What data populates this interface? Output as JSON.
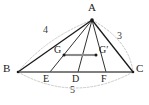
{
  "figure": {
    "background_color": "#ffffff",
    "stroke_color": "#1a1a1a",
    "midsegment_color": "#8a8a8a",
    "arc_color": "#b5b5b5",
    "vertices": [
      {
        "name": "A",
        "label": "A",
        "x": 92,
        "y": 20,
        "label_x": 88,
        "label_y": 4,
        "dot": true
      },
      {
        "name": "B",
        "label": "B",
        "x": 18,
        "y": 72,
        "label_x": 4,
        "label_y": 64,
        "dot": true
      },
      {
        "name": "C",
        "label": "C",
        "x": 133,
        "y": 72,
        "label_x": 137,
        "label_y": 64,
        "dot": true
      }
    ],
    "base_points": [
      {
        "name": "E",
        "label": "E",
        "x": 50,
        "y": 72,
        "label_x": 44,
        "label_y": 76
      },
      {
        "name": "D",
        "label": "D",
        "x": 78,
        "y": 72,
        "label_x": 72,
        "label_y": 76
      },
      {
        "name": "F",
        "label": "F",
        "x": 106,
        "y": 72,
        "label_x": 100,
        "label_y": 76
      }
    ],
    "interior_points": [
      {
        "name": "G",
        "label": "G",
        "x": 64,
        "y": 55,
        "label_x": 54,
        "label_y": 46,
        "dot": true
      },
      {
        "name": "G'",
        "label": "G′",
        "x": 96,
        "y": 55,
        "label_x": 100,
        "label_y": 46,
        "dot": true
      }
    ],
    "segments": [
      {
        "name": "side-AB",
        "from": "A",
        "to": "B",
        "style": "solid",
        "color": "#1a1a1a",
        "width": 1.3
      },
      {
        "name": "side-AC",
        "from": "A",
        "to": "C",
        "style": "solid",
        "color": "#1a1a1a",
        "width": 1.3
      },
      {
        "name": "side-BC",
        "from": "B",
        "to": "C",
        "style": "solid",
        "color": "#555555",
        "width": 1.3
      },
      {
        "name": "cevian-AE",
        "from": "A",
        "to": "E",
        "style": "solid",
        "color": "#1a1a1a",
        "width": 0.9
      },
      {
        "name": "cevian-AD",
        "from": "A",
        "to": "D",
        "style": "solid",
        "color": "#1a1a1a",
        "width": 0.9
      },
      {
        "name": "cevian-AF",
        "from": "A",
        "to": "F",
        "style": "solid",
        "color": "#1a1a1a",
        "width": 0.9
      },
      {
        "name": "midsegment-GG-prime",
        "from": "G",
        "to": "G'",
        "style": "solid",
        "color": "#8a8a8a",
        "width": 2.0
      }
    ],
    "arcs": [
      {
        "name": "arc-side-AB",
        "label": "4",
        "from": "B",
        "to": "A",
        "bulge": "outward-left",
        "label_x": 44,
        "label_y": 27
      },
      {
        "name": "arc-side-AC",
        "label": "3",
        "from": "A",
        "to": "C",
        "bulge": "outward-right",
        "label_x": 118,
        "label_y": 32
      },
      {
        "name": "arc-side-BC",
        "label": "5",
        "from": "B",
        "to": "C",
        "bulge": "outward-below",
        "label_x": 71,
        "label_y": 86
      }
    ],
    "measures": [
      {
        "name": "measure-AB",
        "value": "4",
        "side": "AB"
      },
      {
        "name": "measure-AC",
        "value": "3",
        "side": "AC"
      },
      {
        "name": "measure-BC",
        "value": "5",
        "side": "BC"
      }
    ]
  }
}
